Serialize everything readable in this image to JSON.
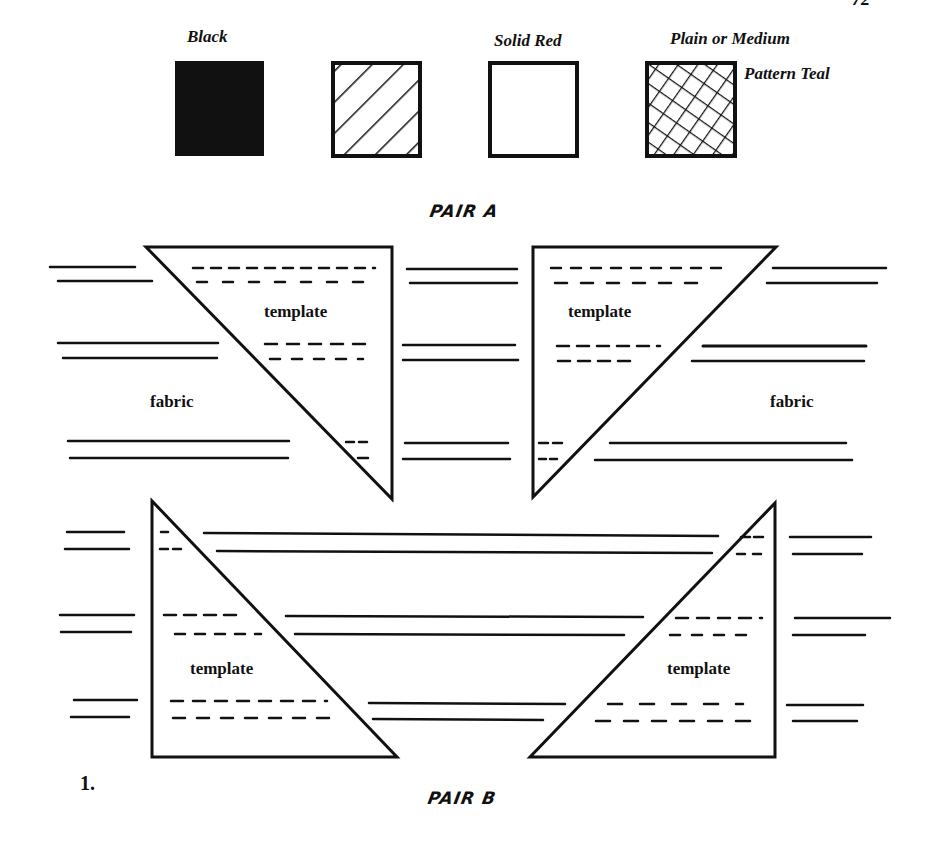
{
  "page": {
    "number_partial": "72"
  },
  "legend": {
    "items": [
      {
        "label": "Black",
        "swatch": "solid-black"
      },
      {
        "label": "",
        "swatch": "diagonal-hatch"
      },
      {
        "label": "Solid Red",
        "swatch": "empty-white"
      },
      {
        "label": "Plain or Medium",
        "label2": "Pattern Teal",
        "swatch": "crosshatch"
      }
    ]
  },
  "pair_a": {
    "title": "PAIR A",
    "left": {
      "template_label": "template",
      "fabric_label": "fabric"
    },
    "right": {
      "template_label": "template",
      "fabric_label": "fabric"
    }
  },
  "pair_b": {
    "title": "PAIR B",
    "left": {
      "template_label": "template"
    },
    "right": {
      "template_label": "template"
    }
  },
  "figure_number": "1.",
  "colors": {
    "ink": "#111111",
    "paper": "#ffffff"
  }
}
